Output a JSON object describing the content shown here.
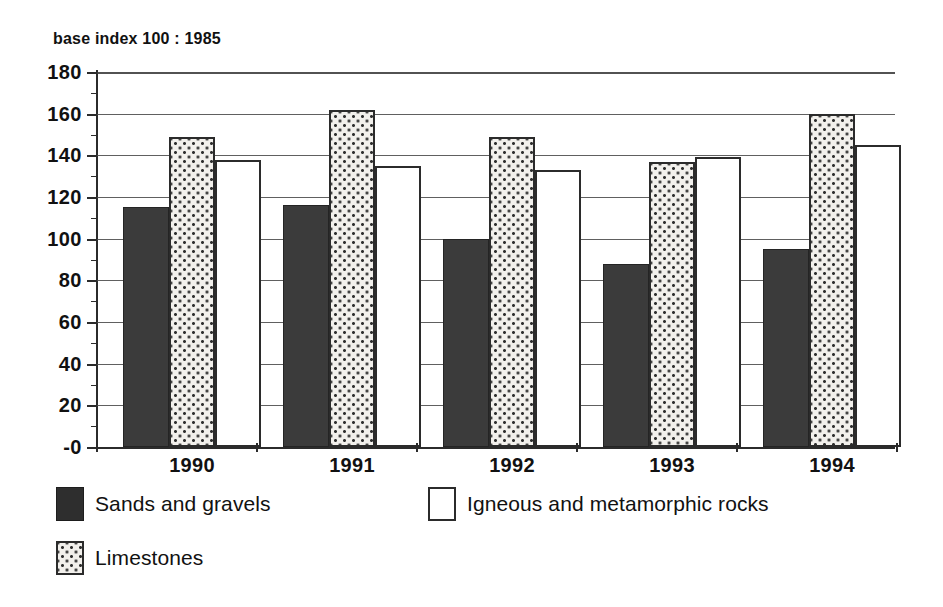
{
  "chart_data": {
    "type": "bar",
    "title": "",
    "subtitle": "base index 100 : 1985",
    "xlabel": "",
    "ylabel": "",
    "categories": [
      "1990",
      "1991",
      "1992",
      "1993",
      "1994"
    ],
    "series": [
      {
        "name": "Sands and gravels",
        "fill": "solid-dark",
        "color": "#3b3b3b",
        "values": [
          115,
          116,
          100,
          88,
          95
        ]
      },
      {
        "name": "Limestones",
        "fill": "dotted",
        "color": "#f2f0ec",
        "values": [
          149,
          162,
          149,
          137,
          160
        ]
      },
      {
        "name": "Igneous and metamorphic rocks",
        "fill": "empty",
        "color": "#ffffff",
        "values": [
          138,
          135,
          133,
          139,
          145
        ]
      }
    ],
    "ylim": [
      0,
      180
    ],
    "ytick_labels": [
      "180",
      "160",
      "140",
      "120",
      "100",
      "80",
      "60",
      "40",
      "20",
      "-0"
    ],
    "ytick_values": [
      180,
      160,
      140,
      120,
      100,
      80,
      60,
      40,
      20,
      0
    ],
    "grid": true,
    "legend_position": "bottom-left",
    "legend": [
      {
        "label": "Sands and gravels",
        "fill": "solid-dark"
      },
      {
        "label": "Igneous and metamorphic rocks",
        "fill": "empty"
      },
      {
        "label": "Limestones",
        "fill": "dotted"
      }
    ]
  },
  "colors": {
    "ink": "#2b2b2b",
    "grid": "#4a4a4a",
    "background": "#ffffff",
    "series_sands": "#3b3b3b",
    "series_limestones": "#f2f0ec",
    "series_igneous": "#ffffff"
  }
}
